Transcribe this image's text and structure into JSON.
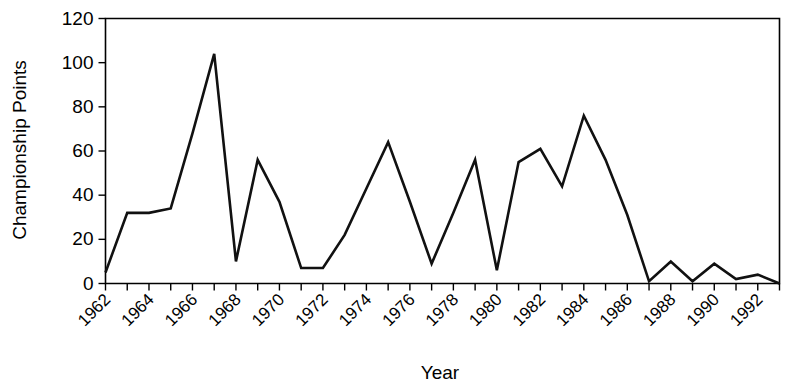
{
  "chart_data": {
    "type": "line",
    "title": "",
    "xlabel": "Year",
    "ylabel": "Championship Points",
    "xlim": [
      1962,
      1993
    ],
    "ylim": [
      0,
      120
    ],
    "grid": false,
    "legend": null,
    "y_ticks": [
      0,
      20,
      40,
      60,
      80,
      100,
      120
    ],
    "y_tick_labels": [
      "0",
      "20",
      "40",
      "60",
      "80",
      "100",
      "120"
    ],
    "x_tick_values": [
      1962,
      1963,
      1964,
      1965,
      1966,
      1967,
      1968,
      1969,
      1970,
      1971,
      1972,
      1973,
      1974,
      1975,
      1976,
      1977,
      1978,
      1979,
      1980,
      1981,
      1982,
      1983,
      1984,
      1985,
      1986,
      1987,
      1988,
      1989,
      1990,
      1991,
      1992,
      1993
    ],
    "x_tick_labels_shown": [
      "1962",
      "1964",
      "1966",
      "1968",
      "1970",
      "1972",
      "1974",
      "1976",
      "1978",
      "1980",
      "1982",
      "1984",
      "1986",
      "1988",
      "1990",
      "1992"
    ],
    "x": [
      1962,
      1963,
      1964,
      1965,
      1966,
      1967,
      1968,
      1969,
      1970,
      1971,
      1972,
      1973,
      1974,
      1975,
      1976,
      1977,
      1978,
      1979,
      1980,
      1981,
      1982,
      1983,
      1984,
      1985,
      1986,
      1987,
      1988,
      1989,
      1990,
      1991,
      1992,
      1993
    ],
    "values": [
      5,
      32,
      32,
      34,
      68,
      104,
      10,
      56,
      37,
      7,
      7,
      22,
      43,
      64,
      37,
      9,
      32,
      56,
      6,
      55,
      61,
      44,
      76,
      56,
      31,
      1,
      10,
      1,
      9,
      2,
      4,
      0
    ],
    "series_name": "Championship Points",
    "line_color": "#111111"
  },
  "axis": {
    "y_title": "Championship Points",
    "x_title": "Year"
  }
}
